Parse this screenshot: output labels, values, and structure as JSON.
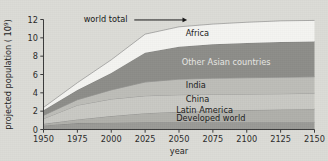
{
  "figure": {
    "background_color": "#dcdcd7",
    "annotation": {
      "text": "world total",
      "icon": "arrow-right-icon"
    }
  },
  "chart_data": {
    "type": "area",
    "stacked": true,
    "title": "",
    "xlabel": "year",
    "ylabel": "projected population ( 10",
    "ylabel_exponent": "9",
    "ylabel_suffix": ")",
    "x": [
      1950,
      1975,
      2000,
      2025,
      2050,
      2075,
      2100,
      2125,
      2150
    ],
    "xticks": [
      "1950",
      "1975",
      "2000",
      "2025",
      "2050",
      "2075",
      "2100",
      "2125",
      "2150"
    ],
    "yticks": [
      "0",
      "2",
      "4",
      "6",
      "8",
      "10",
      "12"
    ],
    "xlim": [
      1950,
      2150
    ],
    "ylim": [
      0,
      12
    ],
    "grid": false,
    "legend_position": "inline-labels",
    "series": [
      {
        "name": "Developed world",
        "color": "#9a9a96",
        "label_color": "dark",
        "values": [
          0.45,
          0.7,
          0.75,
          0.78,
          0.79,
          0.8,
          0.8,
          0.8,
          0.8
        ]
      },
      {
        "name": "Latin America",
        "color": "#b0b0ab",
        "label_color": "dark",
        "values": [
          0.17,
          0.4,
          0.72,
          1.0,
          1.15,
          1.25,
          1.32,
          1.38,
          1.45
        ]
      },
      {
        "name": "China",
        "color": "#c9c9c4",
        "label_color": "dark",
        "values": [
          0.56,
          1.55,
          1.85,
          1.9,
          1.85,
          1.8,
          1.75,
          1.72,
          1.7
        ]
      },
      {
        "name": "India",
        "color": "#bdbdb8",
        "label_color": "dark",
        "values": [
          0.36,
          0.6,
          1.0,
          1.5,
          1.7,
          1.75,
          1.78,
          1.8,
          1.8
        ]
      },
      {
        "name": "Other Asian countries",
        "color": "#8d8d89",
        "label_color": "light",
        "values": [
          0.57,
          1.05,
          1.85,
          3.2,
          3.55,
          3.7,
          3.8,
          3.85,
          3.85
        ]
      },
      {
        "name": "Africa",
        "color": "#f4f4f1",
        "label_color": "dark",
        "values": [
          0.29,
          0.8,
          1.43,
          2.02,
          2.16,
          2.2,
          2.25,
          2.3,
          2.3
        ]
      }
    ],
    "totals": [
      2.4,
      5.1,
      7.6,
      10.4,
      11.2,
      11.5,
      11.7,
      11.85,
      11.9
    ]
  }
}
